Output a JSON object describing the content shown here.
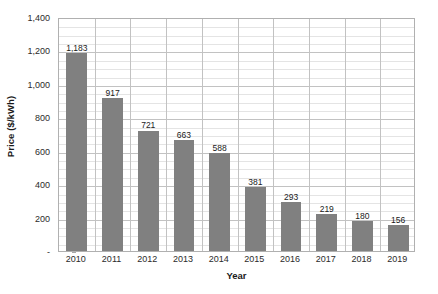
{
  "chart_data": {
    "type": "bar",
    "title": "",
    "xlabel": "Year",
    "ylabel": "Price ($/kWh)",
    "categories": [
      "2010",
      "2011",
      "2012",
      "2013",
      "2014",
      "2015",
      "2016",
      "2017",
      "2018",
      "2019"
    ],
    "values": [
      1183,
      917,
      721,
      663,
      588,
      381,
      293,
      219,
      180,
      156
    ],
    "value_labels": [
      "1,183",
      "917",
      "721",
      "663",
      "588",
      "381",
      "293",
      "219",
      "180",
      "156"
    ],
    "ylim": [
      0,
      1400
    ],
    "y_ticks": [
      0,
      200,
      400,
      600,
      800,
      1000,
      1200,
      1400
    ],
    "y_tick_labels": [
      "-",
      "200",
      "400",
      "600",
      "800",
      "1,000",
      "1,200",
      "1,400"
    ],
    "grid": true,
    "minor_grid_step": 50,
    "major_grid_step": 200,
    "legend": "none",
    "bar_color": "#808080",
    "plot_border_color": "#b0b0b0",
    "minor_gridline_color": "#e4e4e4",
    "major_gridline_color": "#c2c2c2",
    "background_color": "#ffffff",
    "data_label_color": "#1a1a1a"
  }
}
